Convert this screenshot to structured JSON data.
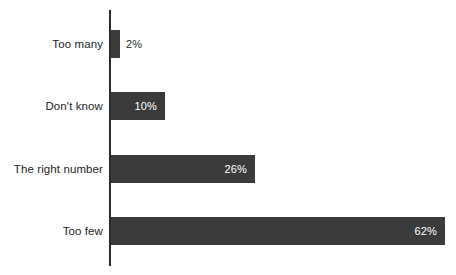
{
  "chart_data": {
    "type": "bar",
    "orientation": "horizontal",
    "title": "",
    "subtitle": "",
    "xlabel": "",
    "ylabel": "",
    "categories": [
      "Too many",
      "Don't know",
      "The right number",
      "Too few"
    ],
    "values": [
      2,
      10,
      26,
      62
    ],
    "value_labels": [
      "2%",
      "10%",
      "26%",
      "62%"
    ],
    "unit": "%",
    "xlim": [
      0,
      64
    ],
    "grid": false,
    "legend": false,
    "legend_position": "none",
    "series": [
      {
        "name": "Share of responses",
        "values": [
          2,
          10,
          26,
          62
        ]
      }
    ],
    "colors": {
      "bar": "#3b3b3b",
      "axis": "#2b2b2b",
      "value_label_inside": "#ffffff",
      "value_label_outside": "#2b2b2b",
      "category_label": "#232323",
      "background": "#ffffff"
    }
  },
  "bars": [
    {
      "category": "Too many",
      "value_label": "2%",
      "bar_px": 9,
      "label_inside": false
    },
    {
      "category": "Don't know",
      "value_label": "10%",
      "bar_px": 54,
      "label_inside": true
    },
    {
      "category": "The right number",
      "value_label": "26%",
      "bar_px": 144,
      "label_inside": true
    },
    {
      "category": "Too few",
      "value_label": "62%",
      "bar_px": 334,
      "label_inside": true
    }
  ]
}
